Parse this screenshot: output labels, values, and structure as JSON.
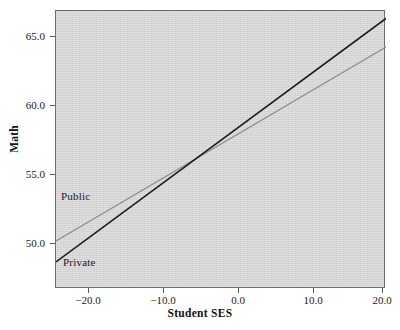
{
  "chart_data": {
    "type": "line",
    "title": "",
    "xlabel": "Student SES",
    "ylabel": "Math",
    "xlim": [
      -22.0,
      22.0
    ],
    "ylim": [
      48.0,
      66.5
    ],
    "xticks": [
      -20.0,
      -10.0,
      0.0,
      10.0,
      20.0
    ],
    "xticklabels": [
      "−20.0",
      "−10.0",
      "0.0",
      "10.0",
      "20.0"
    ],
    "yticks": [
      50.0,
      55.0,
      60.0,
      65.0
    ],
    "yticklabels": [
      "50.0",
      "55.0",
      "60.0",
      "65.0"
    ],
    "grid": false,
    "legend": "in-plot annotations",
    "panel_background": "#d8d8d8",
    "series": [
      {
        "name": "Private",
        "color": "#1a1a1a",
        "linewidth": 1.6,
        "annotation": "Private",
        "x": [
          -22.0,
          22.0
        ],
        "y": [
          49.8,
          66.0
        ],
        "intercept_at_zero": 57.9,
        "slope": 0.368
      },
      {
        "name": "Public",
        "color": "#8e8e8e",
        "linewidth": 1.3,
        "annotation": "Public",
        "x": [
          -22.0,
          22.0
        ],
        "y": [
          51.2,
          64.1
        ],
        "intercept_at_zero": 57.65,
        "slope": 0.293
      }
    ],
    "intersection": {
      "x": -4.4,
      "y": 57.6
    }
  },
  "axes": {
    "x_title": "Student SES",
    "y_title": "Math",
    "x_tick_labels": [
      "−20.0",
      "−10.0",
      "0.0",
      "10.0",
      "20.0"
    ],
    "y_tick_labels": [
      "65.0",
      "60.0",
      "55.0",
      "50.0"
    ]
  },
  "annotations": {
    "public": "Public",
    "private": "Private"
  }
}
